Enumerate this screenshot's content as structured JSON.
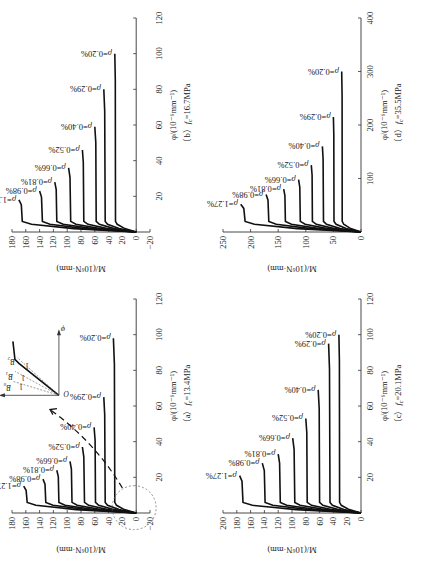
{
  "figure": {
    "rotation_deg": -90,
    "y_label": "M/(10⁶N·mm)",
    "x_label": "φ/(10⁻⁶mm⁻¹)",
    "rho_prefix": "ρ="
  },
  "chart_data": [
    {
      "id": "a",
      "type": "line",
      "title": "（a）f_c=13.4MPa",
      "caption_letter": "（a）",
      "caption_fc": "=13.4MPa",
      "xlabel": "φ/(10⁻⁶mm⁻¹)",
      "ylabel": "M/(10⁶N·mm)",
      "xlim": [
        0,
        120
      ],
      "ylim": [
        -20,
        180
      ],
      "xticks": [
        20,
        40,
        60,
        80,
        100,
        120
      ],
      "yticks": [
        -20,
        0,
        20,
        40,
        60,
        80,
        100,
        120,
        140,
        160,
        180
      ],
      "legend_position": "inline-labels",
      "series": [
        {
          "name": "ρ=1.27%",
          "M_yield": 158,
          "M_ult": 163,
          "phi_ult": 15
        },
        {
          "name": "ρ=0.98%",
          "M_yield": 131,
          "M_ult": 135,
          "phi_ult": 19
        },
        {
          "name": "ρ=0.81%",
          "M_yield": 112,
          "M_ult": 115,
          "phi_ult": 24
        },
        {
          "name": "ρ=0.66%",
          "M_yield": 93,
          "M_ult": 96,
          "phi_ult": 29
        },
        {
          "name": "ρ=0.52%",
          "M_yield": 75,
          "M_ult": 78,
          "phi_ult": 37
        },
        {
          "name": "ρ=0.40%",
          "M_yield": 59,
          "M_ult": 61,
          "phi_ult": 48
        },
        {
          "name": "ρ=0.29%",
          "M_yield": 45,
          "M_ult": 47,
          "phi_ult": 65
        },
        {
          "name": "ρ=0.20%",
          "M_yield": 31,
          "M_ult": 33,
          "phi_ult": 98
        }
      ],
      "annotations": {
        "dashed_circle_near_origin": true,
        "dashed_arrow_to_inset": true,
        "inset": {
          "axis_x": "φ",
          "axis_y": "M",
          "origin": "O",
          "labels": [
            "B₀",
            "B₁",
            "B₂",
            "1",
            "1",
            "1"
          ]
        }
      }
    },
    {
      "id": "b",
      "type": "line",
      "title": "（b）f_c=16.7MPa",
      "caption_letter": "（b）",
      "caption_fc": "=16.7MPa",
      "xlabel": "φ/(10⁻⁶mm⁻¹)",
      "ylabel": "M/(10⁶N·mm)",
      "xlim": [
        0,
        120
      ],
      "ylim": [
        -20,
        180
      ],
      "xticks": [
        20,
        40,
        60,
        80,
        100,
        120
      ],
      "yticks": [
        -20,
        0,
        20,
        40,
        60,
        80,
        100,
        120,
        140,
        160,
        180
      ],
      "legend_position": "inline-labels",
      "series": [
        {
          "name": "ρ=1.27%",
          "M_yield": 165,
          "M_ult": 170,
          "phi_ult": 18
        },
        {
          "name": "ρ=0.98%",
          "M_yield": 136,
          "M_ult": 140,
          "phi_ult": 23
        },
        {
          "name": "ρ=0.81%",
          "M_yield": 115,
          "M_ult": 118,
          "phi_ult": 28
        },
        {
          "name": "ρ=0.66%",
          "M_yield": 95,
          "M_ult": 98,
          "phi_ult": 36
        },
        {
          "name": "ρ=0.52%",
          "M_yield": 76,
          "M_ult": 78,
          "phi_ult": 46
        },
        {
          "name": "ρ=0.40%",
          "M_yield": 58,
          "M_ult": 60,
          "phi_ult": 59
        },
        {
          "name": "ρ=0.29%",
          "M_yield": 45,
          "M_ult": 47,
          "phi_ult": 80
        },
        {
          "name": "ρ=0.20%",
          "M_yield": 30,
          "M_ult": 31,
          "phi_ult": 100
        }
      ]
    },
    {
      "id": "c",
      "type": "line",
      "title": "（c）f_c=20.1MPa",
      "caption_letter": "（c）",
      "caption_fc": "=20.1MPa",
      "xlabel": "φ/(10⁻⁶mm⁻¹)",
      "ylabel": "M/(10⁶N·mm)",
      "xlim": [
        0,
        120
      ],
      "ylim": [
        0,
        200
      ],
      "xticks": [
        20,
        40,
        60,
        80,
        100,
        120
      ],
      "yticks": [
        0,
        20,
        40,
        60,
        80,
        100,
        120,
        140,
        160,
        180,
        200
      ],
      "legend_position": "inline-labels",
      "series": [
        {
          "name": "ρ=1.27%",
          "M_yield": 171,
          "M_ult": 176,
          "phi_ult": 21
        },
        {
          "name": "ρ=0.98%",
          "M_yield": 139,
          "M_ult": 143,
          "phi_ult": 28
        },
        {
          "name": "ρ=0.81%",
          "M_yield": 117,
          "M_ult": 120,
          "phi_ult": 33
        },
        {
          "name": "ρ=0.66%",
          "M_yield": 96,
          "M_ult": 99,
          "phi_ult": 42
        },
        {
          "name": "ρ=0.52%",
          "M_yield": 78,
          "M_ult": 80,
          "phi_ult": 53
        },
        {
          "name": "ρ=0.40%",
          "M_yield": 60,
          "M_ult": 62,
          "phi_ult": 69
        },
        {
          "name": "ρ=0.29%",
          "M_yield": 45,
          "M_ult": 47,
          "phi_ult": 95
        },
        {
          "name": "ρ=0.20%",
          "M_yield": 31,
          "M_ult": 32,
          "phi_ult": 100
        }
      ]
    },
    {
      "id": "d",
      "type": "line",
      "title": "（d）f_c=35.5MPa",
      "caption_letter": "（d）",
      "caption_fc": "=35.5MPa",
      "xlabel": "φ/(10⁻⁶mm⁻¹)",
      "ylabel": "M/(10⁶N·mm)",
      "xlim": [
        0,
        400
      ],
      "ylim": [
        0,
        250
      ],
      "xticks": [
        100,
        200,
        300,
        400
      ],
      "yticks": [
        0,
        50,
        100,
        150,
        200,
        250
      ],
      "legend_position": "inline-labels",
      "series": [
        {
          "name": "ρ=1.27%",
          "M_yield": 210,
          "M_ult": 218,
          "phi_ult": 52
        },
        {
          "name": "ρ=0.98%",
          "M_yield": 167,
          "M_ult": 172,
          "phi_ult": 70
        },
        {
          "name": "ρ=0.81%",
          "M_yield": 137,
          "M_ult": 140,
          "phi_ult": 80
        },
        {
          "name": "ρ=0.66%",
          "M_yield": 110,
          "M_ult": 113,
          "phi_ult": 98
        },
        {
          "name": "ρ=0.52%",
          "M_yield": 88,
          "M_ult": 90,
          "phi_ult": 125
        },
        {
          "name": "ρ=0.40%",
          "M_yield": 68,
          "M_ult": 70,
          "phi_ult": 160
        },
        {
          "name": "ρ=0.29%",
          "M_yield": 49,
          "M_ult": 50,
          "phi_ult": 215
        },
        {
          "name": "ρ=0.20%",
          "M_yield": 34,
          "M_ult": 35,
          "phi_ult": 300
        }
      ]
    }
  ]
}
